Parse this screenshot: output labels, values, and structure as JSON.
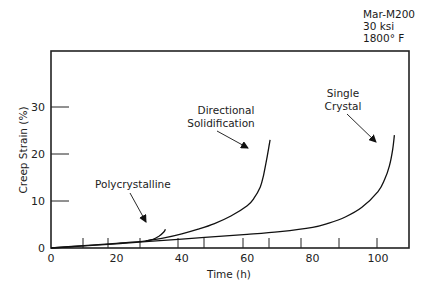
{
  "chart_data": {
    "type": "line",
    "title": "",
    "conditions": [
      "Mar-M200",
      "30 ksi",
      "1800° F"
    ],
    "xlabel": "Time (h)",
    "ylabel": "Creep Strain (%)",
    "xlim": [
      0,
      110
    ],
    "ylim": [
      0,
      38
    ],
    "x_ticks": [
      0,
      20,
      40,
      60,
      80,
      100
    ],
    "y_ticks": [
      0,
      10,
      20,
      30
    ],
    "grid": false,
    "legend": "inline annotations with arrows",
    "series": [
      {
        "name": "Polycrystalline",
        "x": [
          0,
          10,
          20,
          28,
          31,
          33,
          34.5,
          35
        ],
        "y": [
          0,
          0.5,
          1.0,
          1.4,
          1.8,
          2.5,
          3.4,
          4.0
        ]
      },
      {
        "name": "Directional Solidification",
        "x": [
          29,
          35,
          40,
          45,
          50,
          55,
          60,
          62,
          64,
          65,
          66,
          67
        ],
        "y": [
          1.5,
          2.2,
          3.0,
          4.0,
          5.2,
          6.8,
          9.0,
          10.5,
          13.0,
          15.5,
          19.0,
          23.0
        ]
      },
      {
        "name": "Single Crystal",
        "x": [
          0,
          20,
          40,
          60,
          70,
          80,
          85,
          90,
          95,
          100,
          102,
          103.5,
          104.5,
          105
        ],
        "y": [
          0,
          0.9,
          1.9,
          2.9,
          3.5,
          4.4,
          5.3,
          6.6,
          8.6,
          12.0,
          14.5,
          17.5,
          21.0,
          24.0
        ]
      }
    ]
  },
  "annotations": {
    "conditions": [
      "Mar-M200",
      "30 ksi",
      "1800° F"
    ],
    "polycrystalline": "Polycrystalline",
    "directional": [
      "Directional",
      "Solidification"
    ],
    "single_crystal": [
      "Single",
      "Crystal"
    ]
  },
  "axes": {
    "x_label": "Time (h)",
    "y_label": "Creep Strain (%)",
    "x_tick_labels": [
      "0",
      "20",
      "40",
      "60",
      "80",
      "100"
    ],
    "y_tick_labels": [
      "0",
      "10",
      "20",
      "30"
    ]
  }
}
